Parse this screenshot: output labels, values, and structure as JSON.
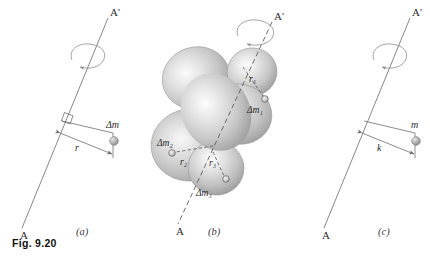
{
  "figure": {
    "caption": "Fig. 9.20",
    "background_color": "#ffffff",
    "axis_color": "#7a7a7a",
    "body_fill_light": "#f2f2f2",
    "body_fill_mid": "#cfcfcf",
    "body_fill_dark": "#9e9e9e",
    "particle_color": "#a8a8a8"
  },
  "panels": [
    {
      "id": "a",
      "letter": "(a)",
      "axis_top_label": "A'",
      "axis_bottom_label": "A",
      "spin_arrow": "rotation-arrow",
      "right_angle_marker": true,
      "distance_label": "r",
      "mass_label": "Δm"
    },
    {
      "id": "b",
      "letter": "(b)",
      "axis_top_label": "A'",
      "axis_bottom_label": "A",
      "spin_arrow": "rotation-arrow",
      "body": "irregular-rigid-body",
      "elements": [
        {
          "distance_label": "r₁",
          "mass_label": "Δm₁"
        },
        {
          "distance_label": "r₂",
          "mass_label": "Δm₂"
        },
        {
          "distance_label": "r₃",
          "mass_label": "Δm₃"
        }
      ]
    },
    {
      "id": "c",
      "letter": "(c)",
      "axis_top_label": "A'",
      "axis_bottom_label": "A",
      "spin_arrow": "rotation-arrow",
      "right_angle_marker": false,
      "distance_label": "k",
      "mass_label": "m"
    }
  ]
}
